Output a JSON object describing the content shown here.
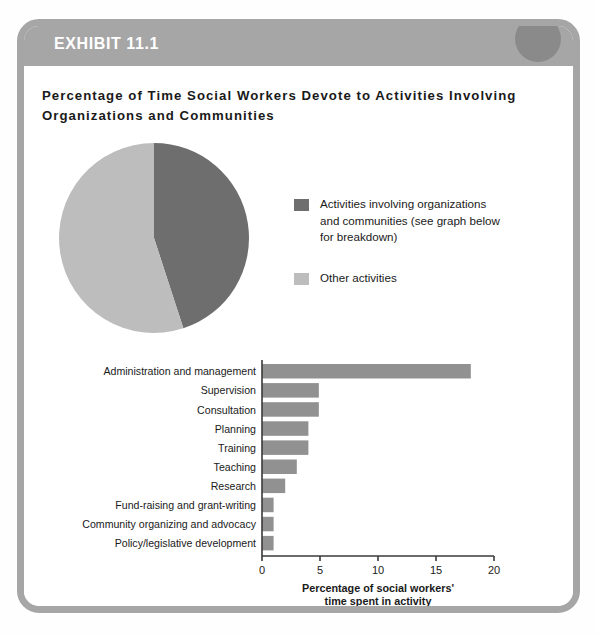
{
  "exhibit": {
    "label": "EXHIBIT 11.1",
    "title": "Percentage of Time Social Workers Devote to Activities Involving Organizations and Communities"
  },
  "colors": {
    "frame": "#a6a6a6",
    "header_band": "#a6a6a6",
    "header_circle": "#8a8a8a",
    "pie_dark": "#6e6e6e",
    "pie_light": "#bdbdbd",
    "bar_fill": "#919191",
    "axis": "#3a3a3a",
    "text": "#1a1a1a"
  },
  "legend": {
    "items": [
      {
        "swatch_color": "#6e6e6e",
        "lines": [
          "Activities involving organizations",
          "and communities (see graph below",
          "for  breakdown)"
        ]
      },
      {
        "swatch_color": "#bdbdbd",
        "lines": [
          "Other activities"
        ]
      }
    ]
  },
  "chart_data": [
    {
      "type": "pie",
      "title": "",
      "labels": [
        "Activities involving organizations and communities (see graph below for breakdown)",
        "Other activities"
      ],
      "values": [
        45,
        55
      ],
      "colors": [
        "#6e6e6e",
        "#bdbdbd"
      ],
      "start_angle": 0,
      "direction": "clockwise",
      "legend": "right"
    },
    {
      "type": "bar",
      "orientation": "horizontal",
      "title": "",
      "categories": [
        "Administration and management",
        "Supervision",
        "Consultation",
        "Planning",
        "Training",
        "Teaching",
        "Research",
        "Fund-raising and grant-writing",
        "Community organizing and advocacy",
        "Policy/legislative development"
      ],
      "values": [
        18,
        4.9,
        4.9,
        4,
        4,
        3,
        2,
        1,
        1,
        1
      ],
      "xlabel": "Percentage of social workers' time spent in activity",
      "xlabel_lines": [
        "Percentage of social workers'",
        "time spent in activity"
      ],
      "ylabel": "",
      "xlim": [
        0,
        20
      ],
      "xticks": [
        0,
        5,
        10,
        15,
        20
      ],
      "xtick_labels": [
        "0",
        "5",
        "10",
        "15",
        "20"
      ],
      "grid": false,
      "bar_color": "#919191"
    }
  ]
}
